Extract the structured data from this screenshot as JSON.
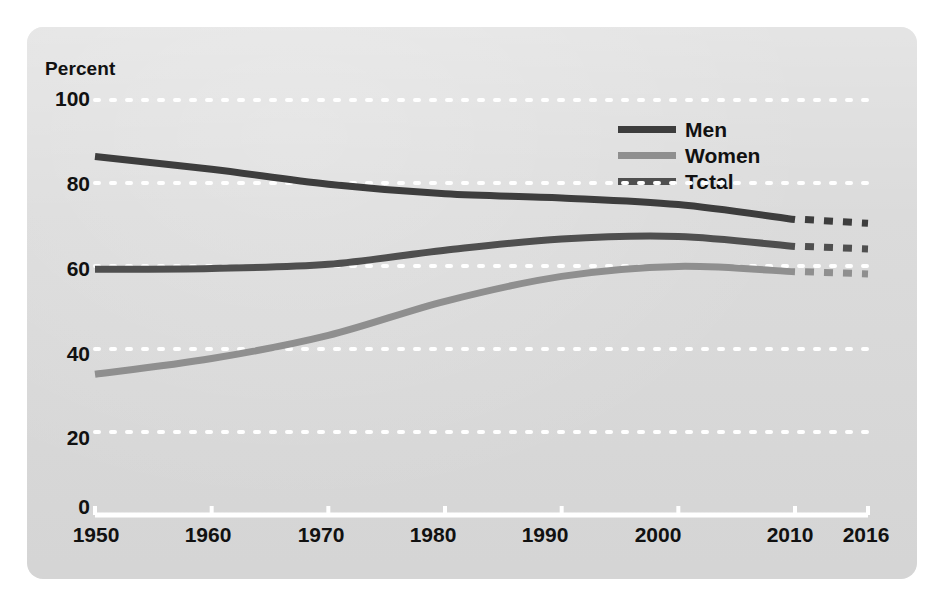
{
  "panel": {
    "background_color": "#d9d9d9",
    "corner_radius_px": 16
  },
  "axis_title": "Percent",
  "legend": {
    "position": "inside-top-right",
    "entries": [
      {
        "label": "Men",
        "color": "#3d3d3d"
      },
      {
        "label": "Women",
        "color": "#8f8f8f"
      },
      {
        "label": "Total",
        "color": "#4f4f4f"
      }
    ]
  },
  "y_axis": {
    "label": "Percent",
    "ticks": [
      "0",
      "20",
      "40",
      "60",
      "80",
      "100"
    ],
    "min": 0,
    "max": 100
  },
  "x_axis": {
    "ticks": [
      "1950",
      "1960",
      "1970",
      "1980",
      "1990",
      "2000",
      "2010",
      "2016"
    ],
    "min": 1950,
    "max": 2016,
    "axis_line_color": "#ffffff"
  },
  "chart_data": {
    "type": "line",
    "title": "Percent",
    "xlabel": "",
    "ylabel": "Percent",
    "xlim": [
      1950,
      2016
    ],
    "ylim": [
      0,
      100
    ],
    "grid": "horizontal-dotted-white",
    "legend_position": "inside-top-right",
    "projection_note": "Dashed segments from 2010 to 2016 indicate projected values",
    "x": [
      1950,
      1960,
      1970,
      1980,
      1990,
      2000,
      2010,
      2016
    ],
    "series": [
      {
        "name": "Men",
        "color": "#3d3d3d",
        "values": [
          86.4,
          83.3,
          79.7,
          77.4,
          76.4,
          74.8,
          71.2,
          70.3
        ],
        "solid_through": 2010,
        "dashed_from": 2010
      },
      {
        "name": "Women",
        "color": "#8f8f8f",
        "values": [
          33.9,
          37.7,
          43.3,
          51.5,
          57.5,
          59.9,
          58.6,
          58.1
        ],
        "solid_through": 2010,
        "dashed_from": 2010
      },
      {
        "name": "Total",
        "color": "#4f4f4f",
        "values": [
          59.2,
          59.4,
          60.4,
          63.8,
          66.5,
          67.1,
          64.7,
          64.1
        ],
        "solid_through": 2010,
        "dashed_from": 2010
      }
    ]
  }
}
